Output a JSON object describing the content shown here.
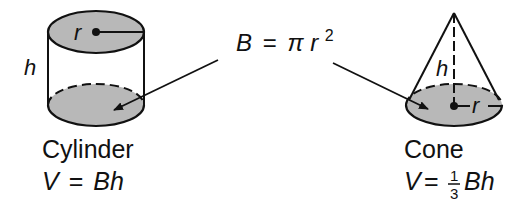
{
  "shared_formula": {
    "lhs": "B",
    "eq": "=",
    "pi": "π",
    "r": "r",
    "exp": "2"
  },
  "cylinder": {
    "name": "Cylinder",
    "radius_label": "r",
    "height_label": "h",
    "formula_lhs": "V",
    "formula_eq": "=",
    "formula_rhs": "Bh"
  },
  "cone": {
    "name": "Cone",
    "radius_label": "r",
    "height_label": "h",
    "formula_lhs": "V",
    "formula_eq": "=",
    "frac_num": "1",
    "frac_den": "3",
    "formula_rhs": "Bh"
  },
  "colors": {
    "base_fill": "#b8b8b8",
    "stroke": "#111111"
  }
}
